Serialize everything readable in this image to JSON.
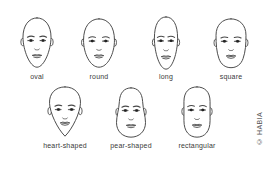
{
  "figure": {
    "credit": "© HABIA"
  },
  "faces": [
    {
      "id": "oval",
      "label": "oval"
    },
    {
      "id": "round",
      "label": "round"
    },
    {
      "id": "long",
      "label": "long"
    },
    {
      "id": "square",
      "label": "square"
    },
    {
      "id": "heart-shaped",
      "label": "heart-shaped"
    },
    {
      "id": "pear-shaped",
      "label": "pear-shaped"
    },
    {
      "id": "rectangular",
      "label": "rectangular"
    }
  ],
  "colors": {
    "line": "#474747",
    "eye_fill": "#222222",
    "label_text": "#3a3a3a",
    "credit_text": "#555555",
    "background": "#ffffff"
  }
}
